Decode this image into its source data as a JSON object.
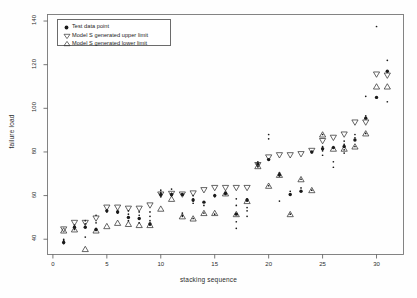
{
  "chart_data": {
    "type": "scatter",
    "title": "",
    "xlabel": "stacking sequence",
    "ylabel": "failure load",
    "xlim": [
      -0.5,
      32.5
    ],
    "ylim": [
      33,
      143
    ],
    "xticks": [
      0,
      5,
      10,
      15,
      20,
      25,
      30
    ],
    "yticks": [
      40,
      60,
      80,
      100,
      120,
      140
    ],
    "grid": false,
    "legend_position": "top-left",
    "legend": [
      {
        "label": "Test data point",
        "marker": "filled-circle"
      },
      {
        "label": "Model S generated upper limit",
        "marker": "down-triangle"
      },
      {
        "label": "Model S generated lower limit",
        "marker": "up-triangle"
      }
    ],
    "series": [
      {
        "name": "Model S generated upper limit",
        "marker": "down-triangle",
        "x": [
          1,
          2,
          3,
          4,
          5,
          6,
          7,
          8,
          9,
          10,
          11,
          12,
          13,
          14,
          15,
          16,
          17,
          18,
          19,
          20,
          21,
          22,
          23,
          24,
          25,
          26,
          27,
          28,
          29,
          30,
          31
        ],
        "values": [
          44.5,
          47.5,
          47.5,
          49.5,
          54.5,
          54.5,
          54.0,
          54.0,
          55.5,
          60.5,
          60.8,
          60.5,
          61.0,
          62.5,
          63.5,
          63.5,
          63.5,
          63.5,
          74.0,
          77.5,
          78.5,
          78.5,
          79.0,
          80.5,
          85.0,
          86.5,
          88.0,
          93.5,
          93.5,
          115.5,
          115.0
        ]
      },
      {
        "name": "Model S generated lower limit",
        "marker": "up-triangle",
        "x": [
          1,
          2,
          3,
          4,
          5,
          6,
          7,
          8,
          9,
          10,
          11,
          12,
          13,
          14,
          15,
          16,
          17,
          18,
          19,
          20,
          21,
          22,
          23,
          24,
          25,
          26,
          27,
          28,
          29,
          30,
          31
        ],
        "values": [
          44.0,
          44.5,
          35.5,
          44.0,
          46.0,
          47.5,
          47.0,
          46.5,
          46.5,
          54.0,
          58.5,
          50.5,
          49.5,
          52.0,
          52.0,
          61.0,
          51.5,
          57.5,
          73.5,
          64.5,
          69.5,
          51.5,
          67.5,
          62.5,
          88.0,
          81.5,
          81.5,
          82.5,
          88.5,
          110.0,
          110.0
        ]
      },
      {
        "name": "Test data point",
        "marker": "filled-circle",
        "x": [
          1,
          2,
          3,
          4,
          5,
          6,
          7,
          8,
          9,
          10,
          11,
          12,
          13,
          14,
          15,
          16,
          17,
          18,
          19,
          20,
          21,
          22,
          23,
          24,
          25,
          26,
          27,
          28,
          29,
          30,
          31
        ],
        "values": [
          38.5,
          45.5,
          45.5,
          44.5,
          53.0,
          52.5,
          50.0,
          49.5,
          47.0,
          60.5,
          60.5,
          60.5,
          58.0,
          57.0,
          60.0,
          61.0,
          51.5,
          58.0,
          74.5,
          76.5,
          69.5,
          60.5,
          62.0,
          80.0,
          81.5,
          82.0,
          82.5,
          85.5,
          95.5,
          105.0,
          117.0
        ]
      }
    ],
    "test_point_clusters": [
      {
        "x": 1,
        "values": [
          38.0,
          38.5,
          39.0,
          39.5,
          40.0
        ]
      },
      {
        "x": 2,
        "values": [
          44.5,
          45.5,
          46.5
        ]
      },
      {
        "x": 3,
        "values": [
          41.0,
          45.5,
          47.0,
          48.5
        ]
      },
      {
        "x": 4,
        "values": [
          44.0,
          44.5,
          47.5,
          51.0
        ]
      },
      {
        "x": 5,
        "values": [
          52.5,
          53.0,
          53.5
        ]
      },
      {
        "x": 6,
        "values": [
          52.0,
          52.5,
          53.0
        ]
      },
      {
        "x": 7,
        "values": [
          48.5,
          50.0,
          51.5,
          53.0
        ]
      },
      {
        "x": 8,
        "values": [
          47.5,
          49.5,
          51.0,
          52.5
        ]
      },
      {
        "x": 9,
        "values": [
          46.5,
          47.0,
          48.5,
          50.5,
          52.5
        ]
      },
      {
        "x": 10,
        "values": [
          59.5,
          60.5,
          61.5,
          62.5
        ]
      },
      {
        "x": 11,
        "values": [
          60.0,
          60.5,
          61.0,
          63.0
        ]
      },
      {
        "x": 12,
        "values": [
          50.5,
          51.0,
          52.0
        ]
      },
      {
        "x": 13,
        "values": [
          49.5,
          56.5,
          57.5,
          58.5,
          60.0
        ]
      },
      {
        "x": 14,
        "values": [
          52.0,
          55.5,
          57.0
        ]
      },
      {
        "x": 15,
        "values": [
          51.5,
          59.5,
          60.0,
          60.5
        ]
      },
      {
        "x": 16,
        "values": [
          60.5,
          61.0,
          61.5
        ]
      },
      {
        "x": 17,
        "values": [
          45.0,
          48.0,
          51.5,
          55.5,
          58.5
        ]
      },
      {
        "x": 18,
        "values": [
          50.5,
          53.0,
          54.5,
          57.5,
          58.5
        ]
      },
      {
        "x": 19,
        "values": [
          73.5,
          74.5,
          75.5
        ]
      },
      {
        "x": 20,
        "values": [
          64.5,
          76.5,
          86.0,
          88.0
        ]
      },
      {
        "x": 21,
        "values": [
          57.5,
          69.0,
          69.5,
          70.0,
          70.5
        ]
      },
      {
        "x": 22,
        "values": [
          51.5,
          60.5,
          62.0
        ]
      },
      {
        "x": 23,
        "values": [
          62.0,
          63.5,
          67.5
        ]
      },
      {
        "x": 24,
        "values": [
          62.5,
          80.0
        ]
      },
      {
        "x": 25,
        "values": [
          78.5,
          80.5,
          81.5,
          82.5,
          88.0
        ]
      },
      {
        "x": 26,
        "values": [
          73.0,
          75.5,
          82.0
        ]
      },
      {
        "x": 27,
        "values": [
          79.5,
          81.0,
          82.5,
          83.5,
          85.0
        ]
      },
      {
        "x": 28,
        "values": [
          82.5,
          85.5,
          86.5,
          88.0
        ]
      },
      {
        "x": 29,
        "values": [
          88.5,
          95.5,
          96.5,
          105.5
        ]
      },
      {
        "x": 30,
        "values": [
          105.0,
          137.5
        ]
      },
      {
        "x": 31,
        "values": [
          103.0,
          117.0,
          122.0
        ]
      }
    ]
  }
}
